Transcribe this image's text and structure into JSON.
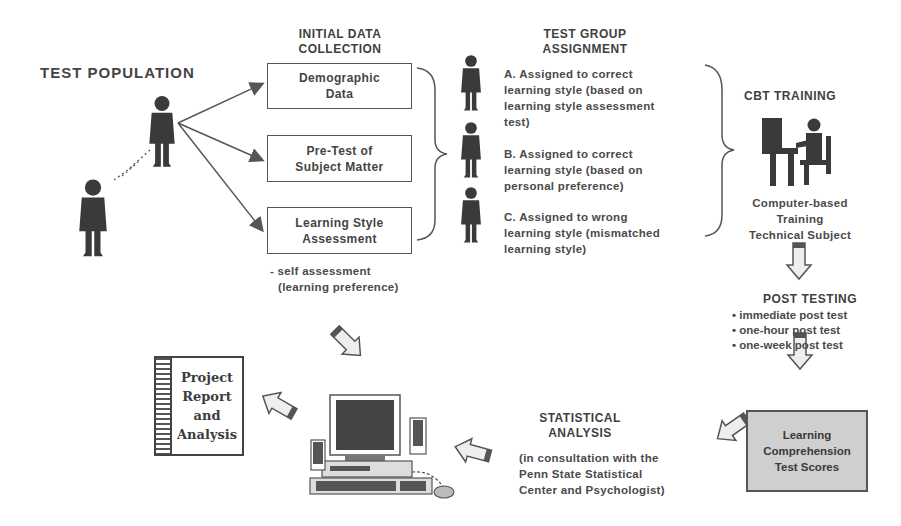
{
  "test_population": {
    "title": "TEST POPULATION"
  },
  "initial_data": {
    "title_line1": "INITIAL DATA",
    "title_line2": "COLLECTION",
    "boxes": [
      {
        "line1": "Demographic",
        "line2": "Data"
      },
      {
        "line1": "Pre-Test of",
        "line2": "Subject Matter"
      },
      {
        "line1": "Learning Style",
        "line2": "Assessment"
      }
    ],
    "note_line1": "- self assessment",
    "note_line2": "(learning preference)"
  },
  "group_assignment": {
    "title_line1": "TEST GROUP",
    "title_line2": "ASSIGNMENT",
    "groups": [
      {
        "lines": [
          "A.  Assigned to correct",
          "learning style (based on",
          "learning style assessment",
          "test)"
        ]
      },
      {
        "lines": [
          "B.  Assigned to correct",
          "learning style (based on",
          "personal preference)"
        ]
      },
      {
        "lines": [
          "C. Assigned to wrong",
          "learning style (mismatched",
          "learning style)"
        ]
      }
    ]
  },
  "cbt_training": {
    "title": "CBT TRAINING",
    "caption_line1": "Computer-based",
    "caption_line2": "Training",
    "caption_line3": "Technical Subject"
  },
  "post_testing": {
    "title": "POST TESTING",
    "items": [
      "immediate post test",
      "one-hour post test",
      "one-week post test"
    ]
  },
  "scores": {
    "line1": "Learning",
    "line2": "Comprehension",
    "line3": "Test Scores"
  },
  "statistical_analysis": {
    "title_line1": "STATISTICAL",
    "title_line2": "ANALYSIS",
    "note_lines": [
      "(in consultation with the",
      "Penn State Statistical",
      "Center and Psychologist)"
    ]
  },
  "report": {
    "line1": "Project",
    "line2": "Report",
    "line3": "and",
    "line4": "Analysis"
  }
}
